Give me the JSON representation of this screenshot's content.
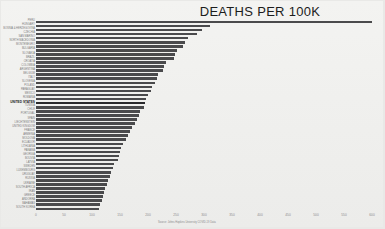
{
  "chart_data": {
    "type": "bar",
    "orientation": "horizontal",
    "title": "DEATHS PER 100K",
    "xlabel": "",
    "ylabel": "",
    "xlim": [
      0,
      600
    ],
    "x_ticks": [
      0,
      50,
      100,
      150,
      200,
      250,
      300,
      350,
      400,
      450,
      500,
      550,
      600
    ],
    "grid": false,
    "legend": null,
    "highlight": "UNITED STATES",
    "source": "Source: Johns Hopkins University COVID-19 Data",
    "categories": [
      "PERU",
      "HUNGARY",
      "BOSNIA & HERZEGOVINA",
      "CZECHIA",
      "SAN MARINO",
      "NORTH MACEDONIA",
      "MONTENEGRO",
      "BULGARIA",
      "SLOVAKIA",
      "BRAZIL",
      "CROATIA",
      "COLOMBIA",
      "ARGENTINA",
      "BELGIUM",
      "ITALY",
      "SLOVENIA",
      "POLAND",
      "PARAGUAY",
      "MEXICO",
      "ROMANIA",
      "UNITED STATES",
      "TUNISIA",
      "CHILE",
      "PORTUGAL",
      "SPAIN",
      "LIECHTENSTEIN",
      "UNITED KINGDOM",
      "FRANCE",
      "ARMENIA",
      "MOLDOVA",
      "ECUADOR",
      "LITHUANIA",
      "PANAMA",
      "GEORGIA",
      "BOLIVIA",
      "LATVIA",
      "SWEDEN",
      "LUXEMBOURG",
      "URUGUAY",
      "RUSSIA",
      "UKRAINE",
      "SOUTH AFRICA",
      "IRAN",
      "GREECE",
      "ANDORRA",
      "BAHAMAS",
      "SOUTH KOREA"
    ],
    "values": [
      600,
      311,
      296,
      287,
      272,
      266,
      262,
      252,
      248,
      246,
      232,
      228,
      226,
      218,
      216,
      212,
      208,
      206,
      200,
      196,
      194,
      192,
      186,
      184,
      180,
      176,
      172,
      168,
      164,
      160,
      156,
      152,
      150,
      148,
      146,
      140,
      138,
      134,
      132,
      128,
      126,
      124,
      122,
      120,
      118,
      114,
      112
    ]
  }
}
